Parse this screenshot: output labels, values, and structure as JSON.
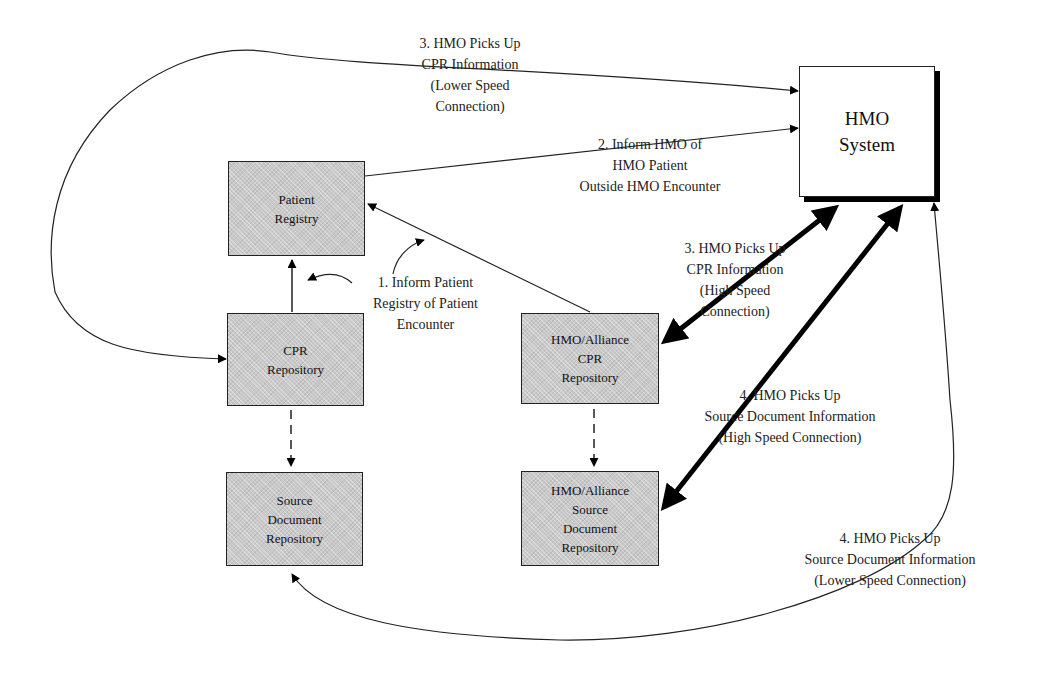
{
  "nodes": {
    "hmo_system": {
      "label": "HMO\nSystem"
    },
    "patient_registry": {
      "label": "Patient\nRegistry"
    },
    "cpr_repository": {
      "label": "CPR\nRepository"
    },
    "source_document_repository": {
      "label": "Source\nDocument\nRepository"
    },
    "alliance_cpr_repository": {
      "label": "HMO/Alliance\nCPR\nRepository"
    },
    "alliance_source_document_repository": {
      "label": "HMO/Alliance\nSource\nDocument\nRepository"
    }
  },
  "edge_labels": {
    "step1": "1. Inform Patient\nRegistry of Patient\nEncounter",
    "step2": "2. Inform HMO of\nHMO Patient\nOutside HMO Encounter",
    "step3_low": "3. HMO Picks Up\nCPR Information\n(Lower Speed\nConnection)",
    "step3_high": "3. HMO Picks Up\nCPR Information\n(High Speed\nConnection)",
    "step4_high": "4. HMO Picks Up\nSource Document Information\n(High Speed Connection)",
    "step4_low": "4. HMO Picks Up\nSource Document Information\n(Lower Speed Connection)"
  },
  "edges": [
    {
      "from": "cpr_repository",
      "to": "patient_registry",
      "style": "solid"
    },
    {
      "from": "alliance_cpr_repository",
      "to": "patient_registry",
      "style": "solid"
    },
    {
      "from": "patient_registry",
      "to": "hmo_system",
      "style": "solid",
      "label": "step2"
    },
    {
      "from": "hmo_system",
      "to": "cpr_repository",
      "style": "solid-curve",
      "label": "step3_low"
    },
    {
      "from": "hmo_system",
      "to": "alliance_cpr_repository",
      "style": "thick-bidirectional",
      "label": "step3_high"
    },
    {
      "from": "hmo_system",
      "to": "alliance_source_document_repository",
      "style": "thick-bidirectional",
      "label": "step4_high"
    },
    {
      "from": "hmo_system",
      "to": "source_document_repository",
      "style": "solid-curve",
      "label": "step4_low"
    },
    {
      "from": "cpr_repository",
      "to": "source_document_repository",
      "style": "dashed"
    },
    {
      "from": "alliance_cpr_repository",
      "to": "alliance_source_document_repository",
      "style": "dashed"
    }
  ]
}
